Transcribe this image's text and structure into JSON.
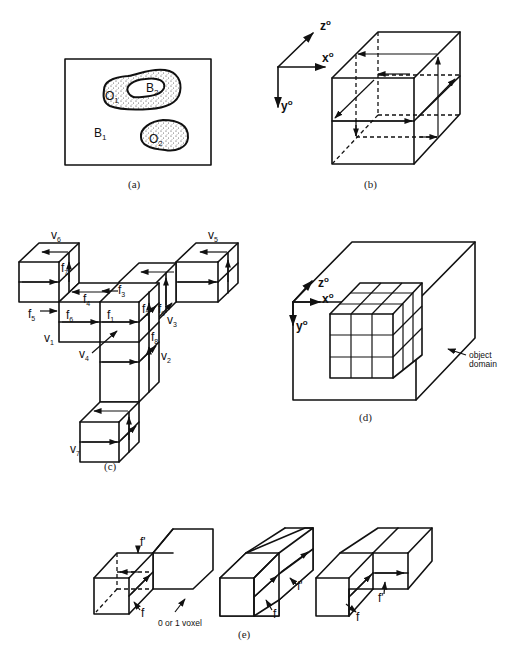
{
  "figure": {
    "panels": [
      {
        "id": "a",
        "caption": "(a)",
        "labels": {
          "background_1": "B",
          "background_1_sub": "1",
          "background_2": "B",
          "background_2_sub": "2",
          "object_1": "O",
          "object_1_sub": "1",
          "object_2": "O",
          "object_2_sub": "2"
        }
      },
      {
        "id": "b",
        "caption": "(b)",
        "axes": {
          "z": "z",
          "x": "x",
          "y": "y",
          "sup": "o"
        }
      },
      {
        "id": "c",
        "caption": "(c)",
        "faces": [
          "f1",
          "f2",
          "f3",
          "f4",
          "f5",
          "f6",
          "f7",
          "f8",
          "f9"
        ],
        "vertices": [
          "v1",
          "v2",
          "v3",
          "v4",
          "v5",
          "v6",
          "v7"
        ]
      },
      {
        "id": "d",
        "caption": "(d)",
        "axes": {
          "z": "z",
          "x": "x",
          "y": "y",
          "sup": "o"
        },
        "annotation_line1": "object",
        "annotation_line2": "domain"
      },
      {
        "id": "e",
        "caption": "(e)",
        "labels": {
          "f": "f",
          "f_prime": "f'",
          "voxel_note": "0 or 1 voxel"
        }
      }
    ]
  }
}
